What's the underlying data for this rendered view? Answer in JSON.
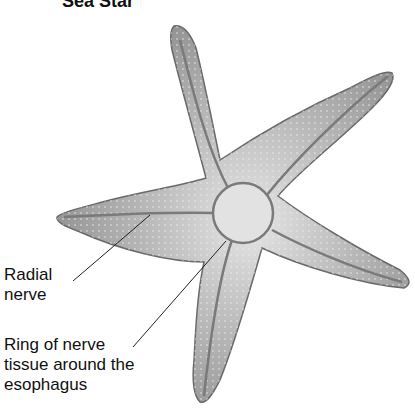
{
  "title": "Sea Star",
  "labels": {
    "radial_nerve": "Radial\nnerve",
    "nerve_ring": "Ring of nerve\ntissue around the\nesophagus"
  },
  "colors": {
    "body_fill": "#a8a8a8",
    "body_light": "#d8d8d8",
    "outline": "#6a6a6a",
    "leader_line": "#222222"
  }
}
